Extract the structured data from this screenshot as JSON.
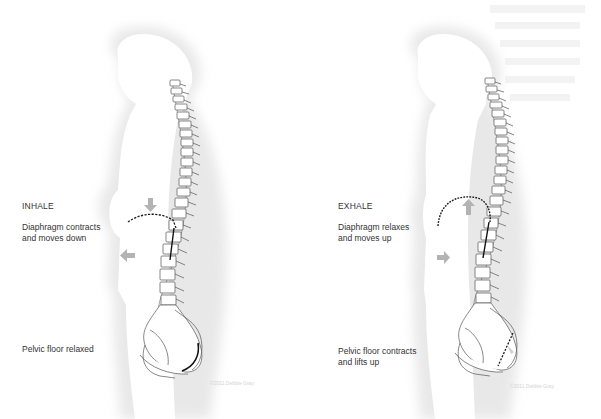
{
  "diagram": {
    "panels": [
      {
        "phase": "INHALE",
        "diaphragm_text_line1": "Diaphragm contracts",
        "diaphragm_text_line2": "and moves down",
        "pelvic_text_line1": "Pelvic floor relaxed",
        "pelvic_text_line2": "",
        "copyright": "©2011 Debbie Gray",
        "arrows": [
          "down-arrow",
          "left-arrow"
        ]
      },
      {
        "phase": "EXHALE",
        "diaphragm_text_line1": "Diaphragm relaxes",
        "diaphragm_text_line2": "and moves up",
        "pelvic_text_line1": "Pelvic floor contracts",
        "pelvic_text_line2": "and lifts up",
        "copyright": "©2011 Debbie Gray",
        "arrows": [
          "up-arrow",
          "right-arrow"
        ]
      }
    ],
    "colors": {
      "silhouette_shadow": "#e6e6e6",
      "bone_outline": "#555555",
      "diaphragm_line": "#1a1a1a",
      "arrow": "#b3b3b3",
      "text": "#333333"
    }
  }
}
